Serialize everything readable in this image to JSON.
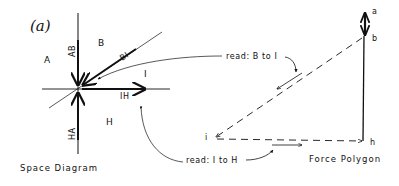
{
  "panel_label": "(a)",
  "space_diagram": {
    "caption": "Space Diagram",
    "regions": {
      "A": "A",
      "B": "B",
      "I": "I",
      "H": "H"
    },
    "members": {
      "AB": "AB",
      "BI": "BI",
      "IH": "IH",
      "HA": "HA"
    }
  },
  "force_polygon": {
    "caption": "Force Polygon",
    "points": {
      "a": "a",
      "b": "b",
      "i": "i",
      "h": "h"
    }
  },
  "annotations": {
    "read_b_to_i": "read: B to I",
    "read_i_to_h": "read: I to H"
  },
  "colors": {
    "ink": "#111111",
    "background": "#ffffff"
  }
}
